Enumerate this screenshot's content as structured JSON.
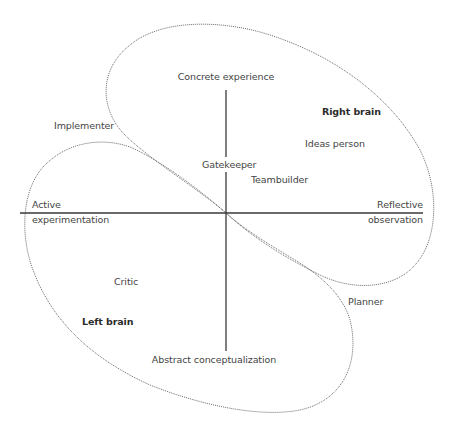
{
  "diagram": {
    "axes": {
      "top": "Concrete experience",
      "bottom": "Abstract conceptualization",
      "left_line1": "Active",
      "left_line2": "experimentation",
      "right_line1": "Reflective",
      "right_line2": "observation"
    },
    "regions": {
      "upper_right": "Right brain",
      "lower_left": "Left brain"
    },
    "roles": {
      "implementer": "Implementer",
      "ideas_person": "Ideas person",
      "gatekeeper": "Gatekeeper",
      "teambuilder": "Teambuilder",
      "critic": "Critic",
      "planner": "Planner"
    },
    "colors": {
      "axis": "#3a3a3a",
      "outline": "#6a6a6a",
      "text": "#444444"
    }
  }
}
